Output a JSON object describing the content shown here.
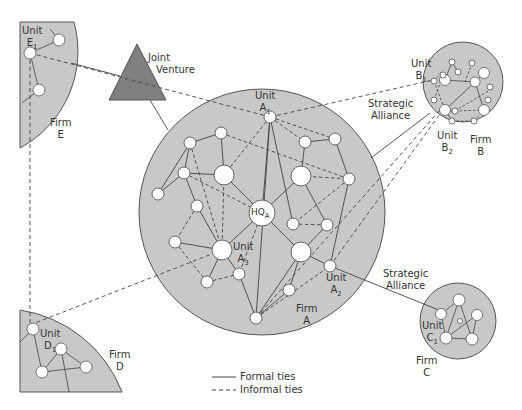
{
  "labels": {
    "joint_venture": [
      "Joint",
      "Venture"
    ],
    "strategic_alliance_top": [
      "Strategic",
      "Alliance"
    ],
    "strategic_alliance_bottom": [
      "Strategic",
      "Alliance"
    ],
    "firm_a": [
      "Firm",
      "A"
    ],
    "firm_b": [
      "Firm",
      "B"
    ],
    "firm_c": [
      "Firm",
      "C"
    ],
    "firm_d": [
      "Firm",
      "D"
    ],
    "firm_e": [
      "Firm",
      "E"
    ],
    "unit_a1": {
      "word": "Unit",
      "id": "A",
      "sub": "1"
    },
    "unit_a2": {
      "word": "Unit",
      "id": "A",
      "sub": "2"
    },
    "unit_a3": {
      "word": "Unit",
      "id": "A",
      "sub": "3"
    },
    "unit_b1": {
      "word": "Unit",
      "id": "B",
      "sub": "1"
    },
    "unit_b2": {
      "word": "Unit",
      "id": "B",
      "sub": "2"
    },
    "unit_c1": {
      "word": "Unit",
      "id": "C",
      "sub": "1"
    },
    "unit_d1": {
      "word": "Unit",
      "id": "D",
      "sub": "1"
    },
    "unit_e1": {
      "word": "Unit",
      "id": "E",
      "sub": "1"
    },
    "hq": {
      "word": "HQ",
      "sub": "A"
    }
  },
  "legend": {
    "formal": "Formal ties",
    "informal": "Informal ties"
  },
  "colors": {
    "firm_fill": "#c8c8c8",
    "firm_stroke": "#555555",
    "triangle_fill": "#808080",
    "node_fill": "#ffffff",
    "line": "#444444"
  }
}
